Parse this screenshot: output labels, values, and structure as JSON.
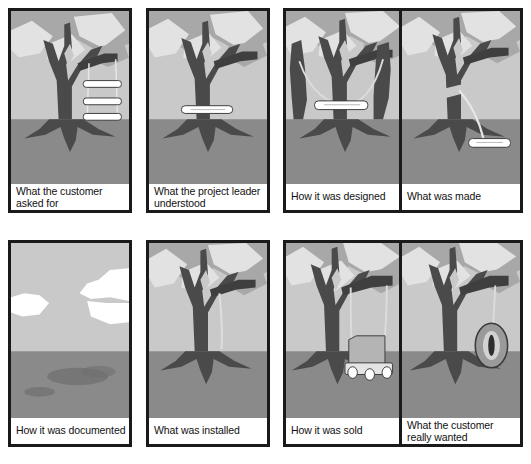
{
  "document": {
    "title": "Tree Swing Project Management Cartoon",
    "layout": "2 rows x 4 columns comic grid",
    "width": 531,
    "height": 464
  },
  "palette": {
    "border": "#1a1a1a",
    "sky": "#c9c9c9",
    "ground": "#8a8a8a",
    "canopy_mid": "#a8a8a8",
    "leaf_light": "#e2e2e2",
    "trunk_dark": "#4a4a4a",
    "white": "#ffffff",
    "caption_text": "#111111",
    "shadow": "#6f6f6f"
  },
  "panels": [
    {
      "id": "panel-1",
      "caption": "What the customer\nasked for",
      "caption_lines": 2,
      "subject": "tree with three stacked swing seats on one pair of ropes",
      "row": 1,
      "column": 1
    },
    {
      "id": "panel-2",
      "caption": "What the project leader\nunderstood",
      "caption_lines": 2,
      "subject": "tree with a single seat board resting against the trunk, no ropes",
      "row": 1,
      "column": 2
    },
    {
      "id": "panel-3",
      "caption": "How it was designed",
      "caption_lines": 1,
      "subject": "tree with two extra free-standing trunk posts and a seat slung between them",
      "row": 1,
      "column": 3
    },
    {
      "id": "panel-4",
      "caption": "What was made",
      "caption_lines": 1,
      "subject": "tree with a single rope from the trunk to a seat lying flat on the ground",
      "row": 1,
      "column": 4
    },
    {
      "id": "panel-5",
      "caption": "How it was documented",
      "caption_lines": 1,
      "subject": "empty landscape with clouds and only dark patches of ground where the tree stood",
      "row": 2,
      "column": 1
    },
    {
      "id": "panel-6",
      "caption": "What was installed",
      "caption_lines": 1,
      "subject": "tree with a single bare rope hanging from a branch and no seat",
      "row": 2,
      "column": 2
    },
    {
      "id": "panel-7",
      "caption": "How it was sold",
      "caption_lines": 1,
      "subject": "tree with a deluxe wheeled bench swing on long ropes",
      "row": 2,
      "column": 3
    },
    {
      "id": "panel-8",
      "caption": "What the customer\nreally wanted",
      "caption_lines": 2,
      "subject": "tree with a simple tire swing hanging from a branch",
      "row": 2,
      "column": 4
    }
  ]
}
